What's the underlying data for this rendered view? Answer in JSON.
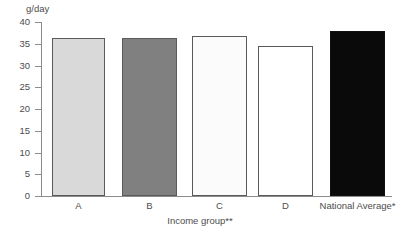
{
  "chart_data": {
    "type": "bar",
    "title": "",
    "subtitle": "",
    "xlabel": "Income group**",
    "ylabel": "g/day",
    "categories": [
      "A",
      "B",
      "C",
      "D",
      "National Average*"
    ],
    "values": [
      36.4,
      36.4,
      36.9,
      34.5,
      38.0
    ],
    "ylim": [
      0,
      40
    ],
    "ytick_labels": [
      "40",
      "35",
      "30",
      "25",
      "20",
      "15",
      "10",
      "5",
      "0"
    ],
    "ytick_values": [
      40,
      35,
      30,
      25,
      20,
      15,
      10,
      5,
      0
    ],
    "grid": false,
    "legend": "none",
    "bar_colors": [
      "#d9d9d9",
      "#808080",
      "#fbfbfb",
      "#ffffff",
      "#0a0a0a"
    ],
    "bar_border_colors": [
      "#5a5a5a",
      "#5a5a5a",
      "#5a5a5a",
      "#5a5a5a",
      "#111111"
    ],
    "series": [
      {
        "name": "Intake",
        "values": [
          36.4,
          36.4,
          36.9,
          34.5,
          38.0
        ]
      }
    ],
    "bars": [
      {
        "category": "A",
        "value": 36.4,
        "color": "#d9d9d9"
      },
      {
        "category": "B",
        "value": 36.4,
        "color": "#808080"
      },
      {
        "category": "C",
        "value": 36.9,
        "color": "#fbfbfb"
      },
      {
        "category": "D",
        "value": 34.5,
        "color": "#ffffff"
      },
      {
        "category": "National Average*",
        "value": 38.0,
        "color": "#0a0a0a"
      }
    ]
  },
  "axes": {
    "y_unit_caption": "g/day",
    "x_axis_title": "Income group**"
  },
  "colors": {
    "axis": "#8c8c8c",
    "text": "#4d4d4d",
    "bar_outline": "#5a5a5a",
    "background": "#ffffff"
  }
}
